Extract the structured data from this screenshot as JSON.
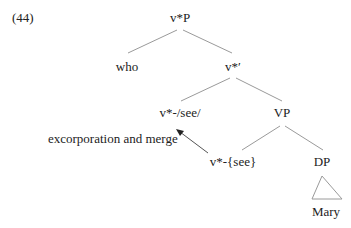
{
  "example_number": "(44)",
  "tree": {
    "root": "v*P",
    "spec": "who",
    "bar": "v*′",
    "head": "v*-/see/",
    "vp": "VP",
    "v_head": "v*-{see}",
    "dp": "DP",
    "dp_content": "Mary"
  },
  "annotation": {
    "arrow_label": "excorporation and merge"
  },
  "colors": {
    "line": "#9a9a9a",
    "text": "#222222",
    "arrow": "#333333"
  }
}
